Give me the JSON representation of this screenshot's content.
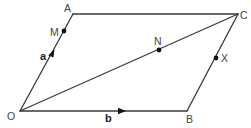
{
  "diagram": {
    "type": "parallelogram-vector-diagram",
    "vertices": {
      "O": {
        "label": "O",
        "x": 20,
        "y": 111
      },
      "A": {
        "label": "A",
        "x": 73,
        "y": 14
      },
      "C": {
        "label": "C",
        "x": 238,
        "y": 14
      },
      "B": {
        "label": "B",
        "x": 187,
        "y": 111
      }
    },
    "points": {
      "M": {
        "label": "M",
        "on": "OA"
      },
      "N": {
        "label": "N",
        "on": "OC"
      },
      "X": {
        "label": "X",
        "on": "BC"
      }
    },
    "vectors": {
      "a": {
        "label": "a",
        "from": "O",
        "to": "A"
      },
      "b": {
        "label": "b",
        "from": "O",
        "to": "B"
      }
    },
    "edges": [
      "OA",
      "AC",
      "CB",
      "BO",
      "OC"
    ],
    "colors": {
      "line": "#3a3a3a",
      "point": "#111111",
      "text": "#444444"
    }
  }
}
